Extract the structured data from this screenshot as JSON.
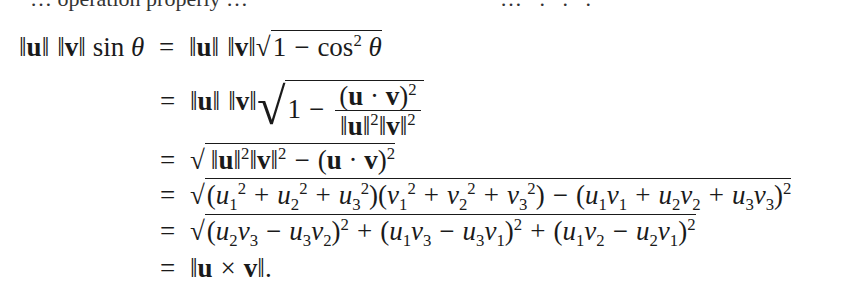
{
  "page": {
    "type": "math-derivation",
    "top_text_clipped": true,
    "top_left_fragment": "… operation properly …",
    "top_right_fragment": "… . . ."
  },
  "derivation": {
    "lhs": "‖u‖ ‖v‖ sin θ",
    "steps": [
      {
        "id": 1,
        "relation": "=",
        "expr": "‖u‖ ‖v‖ √(1 − cos² θ)"
      },
      {
        "id": 2,
        "relation": "=",
        "expr": "‖u‖ ‖v‖ √(1 − (u · v)² / (‖u‖²‖v‖²))"
      },
      {
        "id": 3,
        "relation": "=",
        "expr": "√(‖u‖²‖v‖² − (u · v)²)"
      },
      {
        "id": 4,
        "relation": "=",
        "expr": "√((u₁² + u₂² + u₃²)(v₁² + v₂² + v₃²) − (u₁v₁ + u₂v₂ + u₃v₃)²)"
      },
      {
        "id": 5,
        "relation": "=",
        "expr": "√((u₂v₃ − u₃v₂)² + (u₁v₃ − u₃v₁)² + (u₁v₂ − u₂v₁)²)"
      },
      {
        "id": 6,
        "relation": "=",
        "expr": "‖u × v‖."
      }
    ]
  },
  "glyphs": {
    "eq": "=",
    "minus": "−",
    "plus": "+",
    "dot": "·",
    "times": "×",
    "norm": "‖",
    "theta": "θ",
    "sin": "sin",
    "cos": "cos",
    "one": "1",
    "two": "2",
    "u": "u",
    "v": "v",
    "lp": "(",
    "rp": ")",
    "period": ".",
    "radical": "√"
  }
}
